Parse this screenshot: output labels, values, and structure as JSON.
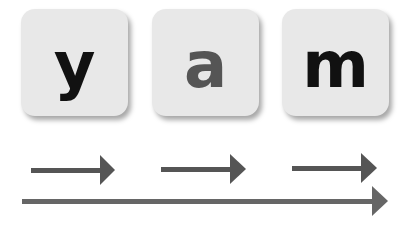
{
  "tiles": [
    {
      "letter": "y",
      "color": "#111111"
    },
    {
      "letter": "a",
      "color": "#555555"
    },
    {
      "letter": "m",
      "color": "#111111"
    }
  ],
  "arrows": {
    "color": "#555555",
    "short_count": 3,
    "long_count": 1
  }
}
